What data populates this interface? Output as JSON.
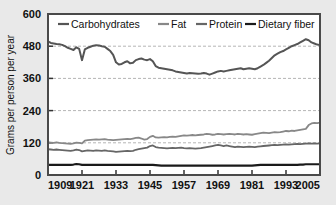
{
  "figure": {
    "background_color": "#e9e9e9",
    "plot_background_color": "#ffffff",
    "frame_color": "#4a4a4a"
  },
  "axis": {
    "ylabel": "Grams per person per year",
    "yticks": [
      "0",
      "120",
      "240",
      "360",
      "480",
      "600"
    ],
    "xticks": [
      "1909",
      "1921",
      "1933",
      "1945",
      "1957",
      "1969",
      "1981",
      "1993",
      "2005"
    ]
  },
  "legend": {
    "items": [
      {
        "label": "Carbohydrates",
        "color": "#555555"
      },
      {
        "label": "Fat",
        "color": "#888888"
      },
      {
        "label": "Protein",
        "color": "#666666"
      },
      {
        "label": "Dietary fiber",
        "color": "#1a1a1a"
      }
    ]
  },
  "chart_data": {
    "type": "line",
    "title": "",
    "xlabel": "",
    "ylabel": "Grams per person per year",
    "xlim": [
      1909,
      2005
    ],
    "ylim": [
      0,
      600
    ],
    "yticks": [
      0,
      120,
      240,
      360,
      480,
      600
    ],
    "xticks": [
      1909,
      1921,
      1933,
      1945,
      1957,
      1969,
      1981,
      1993,
      2005
    ],
    "grid": "horizontal-dashed",
    "legend_position": "top-inside",
    "x": [
      1909,
      1910,
      1911,
      1912,
      1913,
      1914,
      1915,
      1916,
      1917,
      1918,
      1919,
      1920,
      1921,
      1922,
      1923,
      1924,
      1925,
      1926,
      1927,
      1928,
      1929,
      1930,
      1931,
      1932,
      1933,
      1934,
      1935,
      1936,
      1937,
      1938,
      1939,
      1940,
      1941,
      1942,
      1943,
      1944,
      1945,
      1946,
      1947,
      1948,
      1949,
      1950,
      1951,
      1952,
      1953,
      1954,
      1955,
      1956,
      1957,
      1958,
      1959,
      1960,
      1961,
      1962,
      1963,
      1964,
      1965,
      1966,
      1967,
      1968,
      1969,
      1970,
      1971,
      1972,
      1973,
      1974,
      1975,
      1976,
      1977,
      1978,
      1979,
      1980,
      1981,
      1982,
      1983,
      1984,
      1985,
      1986,
      1987,
      1988,
      1989,
      1990,
      1991,
      1992,
      1993,
      1994,
      1995,
      1996,
      1997,
      1998,
      1999,
      2000,
      2001,
      2002,
      2003,
      2004,
      2005
    ],
    "series": [
      {
        "name": "Carbohydrates",
        "color": "#555555",
        "width": 2.0,
        "values": [
          498,
          492,
          490,
          488,
          487,
          485,
          480,
          474,
          470,
          466,
          476,
          470,
          428,
          468,
          474,
          478,
          482,
          484,
          483,
          480,
          478,
          470,
          462,
          448,
          420,
          412,
          414,
          420,
          424,
          416,
          418,
          428,
          432,
          434,
          430,
          428,
          432,
          424,
          406,
          400,
          398,
          396,
          394,
          392,
          390,
          386,
          384,
          382,
          380,
          378,
          380,
          379,
          378,
          377,
          378,
          380,
          378,
          374,
          378,
          382,
          386,
          388,
          386,
          388,
          390,
          392,
          394,
          396,
          398,
          394,
          396,
          398,
          396,
          394,
          398,
          404,
          410,
          418,
          426,
          436,
          446,
          452,
          458,
          462,
          468,
          474,
          480,
          484,
          488,
          494,
          500,
          506,
          502,
          494,
          490,
          486,
          484
        ]
      },
      {
        "name": "Fat",
        "color": "#888888",
        "width": 1.8,
        "values": [
          122,
          121,
          120,
          122,
          120,
          119,
          118,
          117,
          116,
          118,
          121,
          120,
          118,
          128,
          130,
          131,
          132,
          133,
          132,
          133,
          134,
          132,
          131,
          130,
          131,
          132,
          133,
          134,
          135,
          134,
          136,
          138,
          139,
          136,
          132,
          134,
          142,
          146,
          140,
          139,
          140,
          141,
          140,
          142,
          143,
          142,
          144,
          146,
          148,
          147,
          148,
          149,
          148,
          149,
          150,
          151,
          153,
          152,
          150,
          151,
          153,
          152,
          151,
          152,
          153,
          152,
          151,
          153,
          152,
          151,
          152,
          151,
          150,
          152,
          154,
          156,
          158,
          157,
          156,
          158,
          160,
          159,
          160,
          162,
          164,
          163,
          165,
          164,
          166,
          168,
          170,
          172,
          186,
          192,
          194,
          193,
          195
        ]
      },
      {
        "name": "Protein",
        "color": "#666666",
        "width": 1.8,
        "values": [
          96,
          95,
          94,
          95,
          94,
          93,
          92,
          91,
          90,
          92,
          95,
          93,
          88,
          90,
          92,
          91,
          90,
          92,
          91,
          90,
          92,
          90,
          89,
          88,
          86,
          87,
          88,
          89,
          90,
          89,
          90,
          94,
          96,
          98,
          100,
          102,
          108,
          110,
          104,
          102,
          101,
          100,
          99,
          100,
          101,
          100,
          101,
          102,
          100,
          99,
          100,
          99,
          98,
          99,
          100,
          102,
          104,
          106,
          108,
          110,
          112,
          110,
          108,
          110,
          108,
          106,
          104,
          106,
          105,
          104,
          105,
          106,
          105,
          104,
          106,
          107,
          108,
          109,
          110,
          111,
          112,
          111,
          112,
          113,
          114,
          113,
          114,
          115,
          116,
          115,
          116,
          117,
          118,
          117,
          118,
          117,
          118
        ]
      },
      {
        "name": "Dietary fiber",
        "color": "#1a1a1a",
        "width": 2.2,
        "values": [
          38,
          38,
          38,
          38,
          38,
          38,
          38,
          38,
          38,
          39,
          41,
          40,
          38,
          38,
          38,
          38,
          38,
          38,
          38,
          38,
          38,
          38,
          38,
          38,
          38,
          38,
          38,
          38,
          38,
          38,
          38,
          38,
          38,
          38,
          38,
          38,
          38,
          38,
          37,
          36,
          35,
          35,
          35,
          35,
          35,
          35,
          35,
          35,
          35,
          35,
          35,
          35,
          35,
          35,
          35,
          35,
          35,
          35,
          35,
          35,
          35,
          35,
          35,
          35,
          35,
          35,
          35,
          35,
          35,
          35,
          35,
          35,
          35,
          36,
          37,
          38,
          38,
          38,
          38,
          38,
          38,
          38,
          38,
          38,
          38,
          38,
          38,
          38,
          38,
          39,
          39,
          40,
          40,
          40,
          40,
          40,
          40
        ]
      }
    ]
  }
}
